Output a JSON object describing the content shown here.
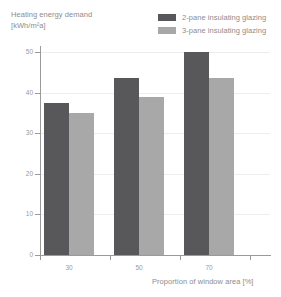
{
  "chart_data": {
    "type": "bar",
    "title": "Heating energy demand",
    "title_unit": "[kWh/m²a]",
    "xlabel": "Proportion of window area [%]",
    "ylabel": "",
    "categories": [
      "30",
      "50",
      "70"
    ],
    "series": [
      {
        "name": "2-pane insulating glazing",
        "values": [
          37.5,
          43.5,
          50.0
        ],
        "color": "#58585a"
      },
      {
        "name": "3-pane insulating glazing",
        "values": [
          35.0,
          39.0,
          43.5
        ],
        "color": "#a8a8a8"
      }
    ],
    "ylim": [
      0,
      50
    ],
    "yticks": [
      0,
      10,
      20,
      30,
      40,
      50
    ],
    "ytick_labels": [
      "0",
      "10",
      "20",
      "30",
      "40",
      "50"
    ],
    "grid": true,
    "legend_position": "top-right"
  },
  "legend": {
    "items": [
      {
        "label": "2-pane insulating glazing",
        "color": "#58585a"
      },
      {
        "label": "3-pane insulating glazing",
        "color": "#a8a8a8"
      }
    ]
  },
  "colors": {
    "series_dark": "#58585a",
    "series_light": "#a8a8a8",
    "axis": "#9a9a9a",
    "grid": "#ededed",
    "text": "#8d8d8d",
    "background": "#ffffff"
  }
}
